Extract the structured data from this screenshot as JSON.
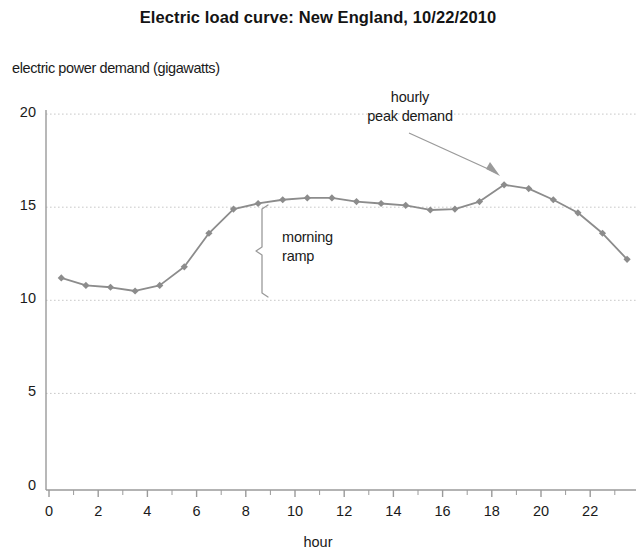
{
  "chart_data": {
    "type": "line",
    "title": "Electric load curve:  New England, 10/22/2010",
    "xlabel": "hour",
    "ylabel": "electric power demand (gigawatts)",
    "x": [
      0.5,
      1.5,
      2.5,
      3.5,
      4.5,
      5.5,
      6.5,
      7.5,
      8.5,
      9.5,
      10.5,
      11.5,
      12.5,
      13.5,
      14.5,
      15.5,
      16.5,
      17.5,
      18.5,
      19.5,
      20.5,
      21.5,
      22.5,
      23.5
    ],
    "values": [
      11.2,
      10.8,
      10.7,
      10.5,
      10.8,
      11.8,
      13.6,
      14.9,
      15.2,
      15.4,
      15.5,
      15.5,
      15.3,
      15.2,
      15.1,
      14.85,
      14.9,
      15.3,
      16.2,
      16.0,
      15.4,
      14.7,
      13.6,
      12.2
    ],
    "series": [
      {
        "name": "electric power demand",
        "values": [
          11.2,
          10.8,
          10.7,
          10.5,
          10.8,
          11.8,
          13.6,
          14.9,
          15.2,
          15.4,
          15.5,
          15.5,
          15.3,
          15.2,
          15.1,
          14.85,
          14.9,
          15.3,
          16.2,
          16.0,
          15.4,
          14.7,
          13.6,
          12.2
        ],
        "color": "#8c8c8c",
        "marker": "diamond"
      }
    ],
    "xlim": [
      0,
      24
    ],
    "ylim": [
      0,
      20.8
    ],
    "y_ticks": [
      0,
      5,
      10,
      15,
      20
    ],
    "y_tick_labels": [
      "0",
      "5",
      "10",
      "15",
      "20"
    ],
    "x_ticks": [
      0,
      2,
      4,
      6,
      8,
      10,
      12,
      14,
      16,
      18,
      20,
      22
    ],
    "x_tick_labels": [
      "0",
      "2",
      "4",
      "6",
      "8",
      "10",
      "12",
      "14",
      "16",
      "18",
      "20",
      "22"
    ],
    "x_minor_tick_step": 1,
    "grid": "horizontal-dotted",
    "grid_color": "#c8c8c8",
    "legend": null,
    "legend_position": "none",
    "annotations": [
      {
        "id": "hourly-peak-demand",
        "text": "hourly\npeak demand",
        "points_to_hour": 18.5,
        "points_to_value": 16.2
      },
      {
        "id": "morning-ramp",
        "text": "morning\nramp",
        "bracket_hour": 8.65,
        "bracket_from_value": 15.0,
        "bracket_to_value": 10.1
      }
    ]
  }
}
